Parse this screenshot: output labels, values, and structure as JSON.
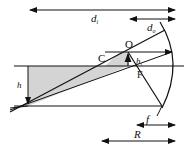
{
  "diagram": {
    "type": "optics-geometry",
    "labels": {
      "d_i": "d",
      "d_i_sub": "i",
      "d_o": "d",
      "d_o_sub": "o",
      "O": "O",
      "C": "C",
      "F": "F",
      "h": "h",
      "h_i": "h",
      "h_i_sub": "i",
      "f": "f",
      "R": "R"
    },
    "colors": {
      "line": "#111111",
      "shade": "#d4d4d4",
      "background": "#ffffff"
    }
  }
}
